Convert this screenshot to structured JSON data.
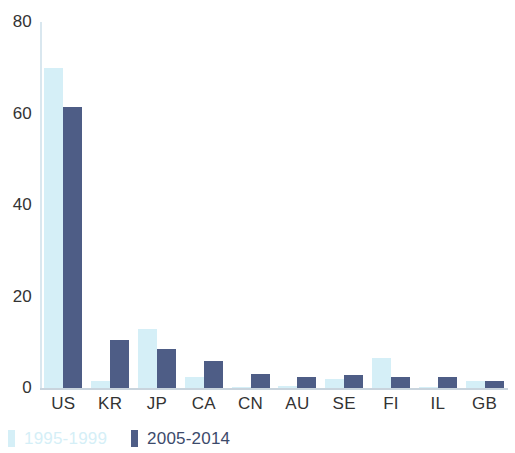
{
  "chart_data": {
    "type": "bar",
    "title": "",
    "subtitle": "",
    "xlabel": "",
    "ylabel": "",
    "categories": [
      "US",
      "KR",
      "JP",
      "CA",
      "CN",
      "AU",
      "SE",
      "FI",
      "IL",
      "GB"
    ],
    "series": [
      {
        "name": "1995-1999",
        "color": "#d5eff7",
        "values": [
          70,
          1.5,
          13,
          2.5,
          0.3,
          0.4,
          2,
          6.5,
          0.3,
          1.5
        ]
      },
      {
        "name": "2005-2014",
        "color": "#4e5d86",
        "values": [
          61.5,
          10.5,
          8.5,
          6,
          3,
          2.5,
          2.8,
          2.5,
          2.4,
          1.5
        ]
      }
    ],
    "ylim": [
      0,
      80
    ],
    "yticks": [
      0,
      20,
      40,
      60,
      80
    ],
    "ytick_labels": [
      "0",
      "20",
      "40",
      "60",
      "80"
    ],
    "grid": false,
    "legend_position": "bottom-left"
  },
  "legend": {
    "entries": [
      {
        "label": "1995-1999",
        "swatch": "light"
      },
      {
        "label": "2005-2014",
        "swatch": "dark"
      }
    ]
  },
  "axis": {
    "y_tick_labels": [
      "80",
      "60",
      "40",
      "20",
      "0"
    ],
    "x_tick_labels": [
      "US",
      "KR",
      "JP",
      "CA",
      "CN",
      "AU",
      "SE",
      "FI",
      "IL",
      "GB"
    ]
  }
}
